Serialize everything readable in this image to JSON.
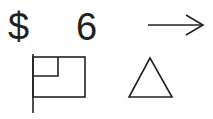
{
  "symbols": {
    "dollar": "$",
    "six": "6"
  },
  "icons": [
    "arrow-right-icon",
    "flag-icon",
    "triangle-icon"
  ],
  "colors": {
    "stroke": "#222222",
    "background": "#ffffff"
  }
}
